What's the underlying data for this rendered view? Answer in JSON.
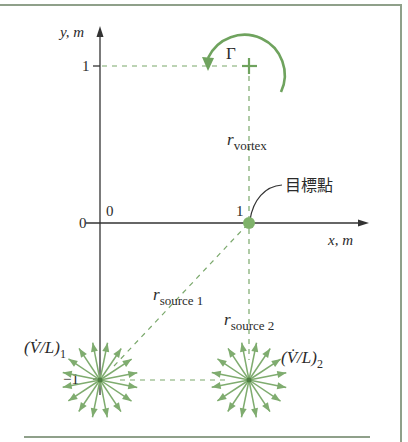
{
  "figure": {
    "type": "diagram",
    "accent_color": "#6fa35e",
    "axes": {
      "x_label": "x, m",
      "y_label": "y, m",
      "x_ticks": [
        {
          "value": 0,
          "label": "0"
        },
        {
          "value": 1,
          "label": "1"
        }
      ],
      "y_ticks": [
        {
          "value": 1,
          "label": "1"
        },
        {
          "value": 0,
          "label": "0"
        },
        {
          "value": -1,
          "label": "−1"
        }
      ]
    },
    "vortex": {
      "x": 1,
      "y": 1,
      "symbol": "Γ",
      "rotation": "counterclockwise",
      "distance_label": "r",
      "distance_subscript": "vortex"
    },
    "target_point": {
      "x": 1,
      "y": 0,
      "label": "目標點"
    },
    "sources": [
      {
        "x": 0,
        "y": -1,
        "strength_label": "(V̇/L)",
        "strength_subscript": "1",
        "distance_label": "r",
        "distance_subscript": "source 1"
      },
      {
        "x": 1,
        "y": -1,
        "strength_label": "(V̇/L)",
        "strength_subscript": "2",
        "distance_label": "r",
        "distance_subscript": "source 2"
      }
    ]
  }
}
